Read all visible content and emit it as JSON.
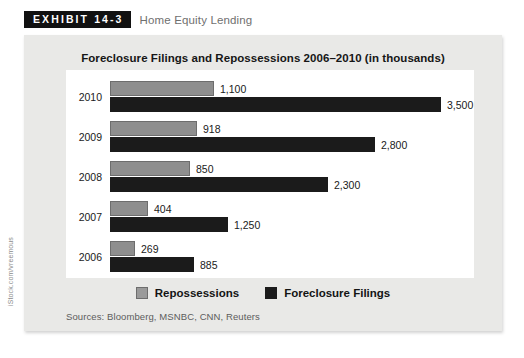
{
  "exhibit": {
    "badge_label": "EXHIBIT 14-3",
    "subtitle": "Home Equity Lending"
  },
  "sources_note": "Sources: Bloomberg, MSNBC, CNN, Reuters",
  "photo_credit": "iStock.com/vreemous",
  "legend": {
    "items": [
      {
        "label": "Repossessions",
        "color": "#9a9a9a"
      },
      {
        "label": "Foreclosure Filings",
        "color": "#1b1b1b"
      }
    ]
  },
  "chart_data": {
    "type": "bar",
    "orientation": "horizontal",
    "title": "Foreclosure Filings and Repossessions 2006–2010 (in thousands)",
    "xlabel": "",
    "ylabel": "",
    "unit": "thousands",
    "grid": false,
    "legend_position": "bottom-center",
    "categories": [
      "2010",
      "2009",
      "2008",
      "2007",
      "2006"
    ],
    "xlim": [
      0,
      3500
    ],
    "series": [
      {
        "name": "Repossessions",
        "color": "#8e8e8e",
        "values": [
          1100,
          918,
          850,
          404,
          269
        ],
        "labels": [
          "1,100",
          "918",
          "850",
          "404",
          "269"
        ]
      },
      {
        "name": "Foreclosure Filings",
        "color": "#1b1b1b",
        "values": [
          3500,
          2800,
          2300,
          1250,
          885
        ],
        "labels": [
          "3,500",
          "2,800",
          "2,300",
          "1,250",
          "885"
        ]
      }
    ]
  }
}
